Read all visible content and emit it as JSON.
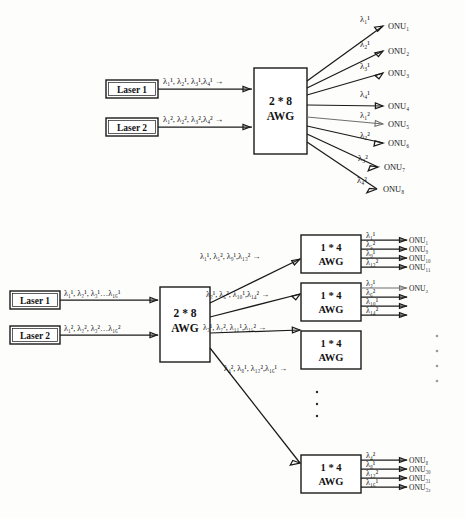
{
  "figure": {
    "ink_color": "#1a1a1a",
    "background": "#fdfdfc"
  },
  "top_diagram": {
    "lasers": [
      {
        "label": "Laser 1"
      },
      {
        "label": "Laser 2"
      }
    ],
    "input_labels": [
      {
        "text": "λ₁¹, λ₂¹, λ₃¹,λ₄¹ →"
      },
      {
        "text": "λ₁², λ₂², λ₃²,λ₄² →"
      }
    ],
    "awg": {
      "line1": "2 * 8",
      "line2": "AWG"
    },
    "outputs": [
      {
        "wavelength": "λ₁¹",
        "onu": "ONU₁"
      },
      {
        "wavelength": "λ₂¹",
        "onu": "ONU₂"
      },
      {
        "wavelength": "λ₃¹",
        "onu": "ONU₃"
      },
      {
        "wavelength": "λ₄¹",
        "onu": "ONU₄"
      },
      {
        "wavelength": "λ₁²",
        "onu": "ONU₅"
      },
      {
        "wavelength": "λ₂²",
        "onu": "ONU₆"
      },
      {
        "wavelength": "λ₃²",
        "onu": "ONU₇"
      },
      {
        "wavelength": "λ₄²",
        "onu": "ONU₈"
      }
    ]
  },
  "bottom_diagram": {
    "lasers": [
      {
        "label": "Laser 1"
      },
      {
        "label": "Laser 2"
      }
    ],
    "input_labels": [
      {
        "text": "λ₁¹, λ₂¹, λ₃¹…λ₁₆¹"
      },
      {
        "text": "λ₁², λ₂², λ₃²…λ₁₆²"
      }
    ],
    "awg": {
      "line1": "2 * 8",
      "line2": "AWG"
    },
    "branch_labels": [
      {
        "text": "λ₁¹, λ₅², λ₉¹,λ₁₃² →"
      },
      {
        "text": "λ₂¹, λ₆², λ₁₀¹,λ₁₄² →"
      },
      {
        "text": "λ₃¹, λ₇², λ₁₁¹,λ₁₅² →"
      },
      {
        "text": "λ₄², λ₈¹, λ₁₂²,λ₁₆¹ →"
      }
    ],
    "sub_awgs": [
      {
        "line1": "1 * 4",
        "line2": "AWG"
      },
      {
        "line1": "1 * 4",
        "line2": "AWG"
      },
      {
        "line1": "1 * 4",
        "line2": "AWG"
      },
      {
        "line1": "1 * 4",
        "line2": "AWG"
      }
    ],
    "sub_awg_outputs": [
      [
        {
          "wavelength": "λ₁¹",
          "onu": "ONU₁"
        },
        {
          "wavelength": "λ₅²",
          "onu": "ONU₉"
        },
        {
          "wavelength": "λ₉¹",
          "onu": "ONU₁₀"
        },
        {
          "wavelength": "λ₁₃²",
          "onu": "ONU₁₁"
        }
      ],
      [
        {
          "wavelength": "λ₂¹",
          "onu": "ONU₂"
        },
        {
          "wavelength": "λ₆²",
          "onu": ""
        },
        {
          "wavelength": "λ₁₀¹",
          "onu": ""
        },
        {
          "wavelength": "λ₁₄²",
          "onu": ""
        }
      ],
      [
        {
          "wavelength": "",
          "onu": ""
        },
        {
          "wavelength": "",
          "onu": ""
        },
        {
          "wavelength": "",
          "onu": ""
        },
        {
          "wavelength": "",
          "onu": ""
        }
      ],
      [
        {
          "wavelength": "λ₄²",
          "onu": "ONU₈"
        },
        {
          "wavelength": "λ₈¹",
          "onu": "ONU₃₀"
        },
        {
          "wavelength": "λ₁₂²",
          "onu": "ONU₃₁"
        },
        {
          "wavelength": "λ₁₆¹",
          "onu": "ONU₃₂"
        }
      ]
    ],
    "ellipsis_center": "⋮",
    "ellipsis_right": "⋮"
  }
}
